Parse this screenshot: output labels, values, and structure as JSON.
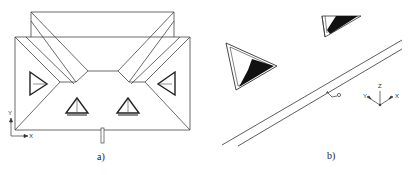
{
  "figure": {
    "panels": [
      {
        "id": "a",
        "caption": "a)",
        "view": "top view (plan) of building roof with skylights",
        "axes": {
          "vertical": "Y",
          "horizontal": "X"
        }
      },
      {
        "id": "b",
        "caption": "b)",
        "view": "3D perspective view of skylights and linear element",
        "axes": {
          "up": "Z",
          "left": "Y",
          "right": "X"
        }
      }
    ],
    "colors": {
      "line": "#333333",
      "fill_dark": "#111111",
      "background": "#ffffff"
    }
  }
}
